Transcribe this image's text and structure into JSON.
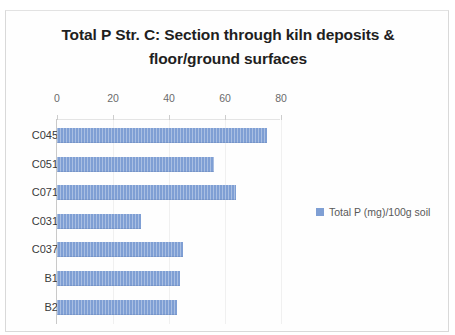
{
  "chart_data": {
    "type": "bar",
    "orientation": "horizontal",
    "title": "Total P Str. C: Section through kiln deposits & floor/ground surfaces",
    "title_line1": "Total P Str. C: Section through kiln deposits &",
    "title_line2": "floor/ground surfaces",
    "categories": [
      "C045",
      "C051",
      "C071",
      "C031",
      "C037",
      "B1",
      "B2"
    ],
    "values": [
      75,
      56,
      64,
      30,
      45,
      44,
      43
    ],
    "series": [
      {
        "name": "Total P (mg)/100g soil",
        "values": [
          75,
          56,
          64,
          30,
          45,
          44,
          43
        ],
        "color": "#7f9fd4"
      }
    ],
    "xlabel": "",
    "ylabel": "",
    "xlim": [
      0,
      80
    ],
    "xticks": [
      0,
      20,
      40,
      60,
      80
    ],
    "xtick_labels": [
      "0",
      "20",
      "40",
      "60",
      "80"
    ],
    "grid": true,
    "legend": {
      "position": "right",
      "entries": [
        "Total P (mg)/100g soil"
      ]
    }
  },
  "legend": {
    "label": "Total P (mg)/100g soil"
  }
}
